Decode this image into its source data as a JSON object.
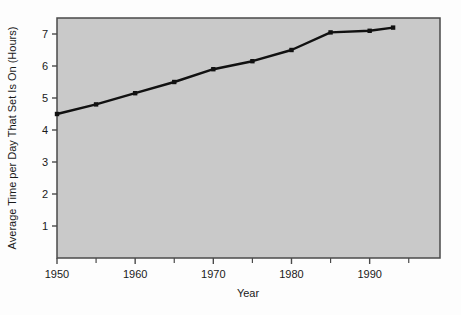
{
  "chart_data": {
    "type": "line",
    "title": "",
    "xlabel": "Year",
    "ylabel": "Average Time per Day That Set Is On (Hours)",
    "x": [
      1950,
      1955,
      1960,
      1965,
      1970,
      1975,
      1980,
      1985,
      1990,
      1993
    ],
    "values": [
      4.5,
      4.8,
      5.15,
      5.5,
      5.9,
      6.15,
      6.5,
      7.05,
      7.1,
      7.2
    ],
    "series": [
      {
        "name": "Average Time per Day That Set Is On",
        "values": [
          4.5,
          4.8,
          5.15,
          5.5,
          5.9,
          6.15,
          6.5,
          7.05,
          7.1,
          7.2
        ]
      }
    ],
    "xlim": [
      1950,
      1999
    ],
    "ylim": [
      0,
      7.5
    ],
    "xticks": [
      1950,
      1960,
      1970,
      1980,
      1990
    ],
    "xtick_labels": [
      "1950",
      "1960",
      "1970",
      "1980",
      "1990"
    ],
    "x_minor_ticks": [
      1955,
      1965,
      1975,
      1985,
      1995
    ],
    "yticks": [
      1,
      2,
      3,
      4,
      5,
      6,
      7
    ],
    "ytick_labels": [
      "1",
      "2",
      "3",
      "4",
      "5",
      "6",
      "7"
    ],
    "grid": false,
    "legend": "none",
    "markers": "square",
    "line_color": "#111111",
    "plot_background": "#c9c9c9",
    "figure_background": "#fdfdfd",
    "border_color": "#4a4a4a"
  }
}
